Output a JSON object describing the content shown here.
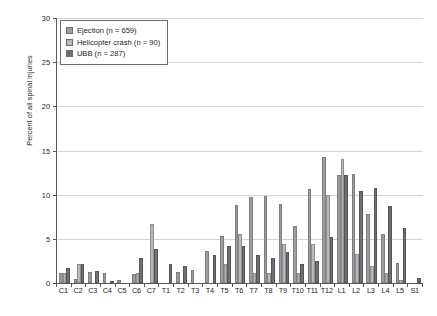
{
  "chart_data": {
    "type": "bar",
    "title": "",
    "subtitle": "",
    "xlabel": "",
    "ylabel": "Percent of all spinal injuries",
    "ylim": [
      0,
      30
    ],
    "yticks": [
      0,
      5,
      10,
      15,
      20,
      25,
      30
    ],
    "grid": "horizontal",
    "legend_position": "top-left",
    "categories": [
      "C1",
      "C2",
      "C3",
      "C4",
      "C5",
      "C6",
      "C7",
      "T1",
      "T2",
      "T3",
      "T4",
      "T5",
      "T6",
      "T7",
      "T8",
      "T9",
      "T10",
      "T11",
      "T12",
      "L1",
      "L2",
      "L3",
      "L4",
      "L5",
      "S1"
    ],
    "series": [
      {
        "name": "Ejection (n = 659)",
        "color": "#9c9d9f",
        "values": [
          1.1,
          0.5,
          1.2,
          1.1,
          0.3,
          1.0,
          0.0,
          0.0,
          1.2,
          1.5,
          3.6,
          5.3,
          8.8,
          9.7,
          9.9,
          8.9,
          6.4,
          10.6,
          14.3,
          12.2,
          12.3,
          7.8,
          5.6,
          2.3,
          0.0
        ]
      },
      {
        "name": "Helicopter crash (n = 90)",
        "color": "#b7b8ba",
        "values": [
          1.1,
          2.2,
          0.0,
          0.0,
          0.0,
          1.1,
          6.7,
          0.0,
          0.0,
          0.0,
          0.0,
          2.2,
          5.6,
          1.1,
          1.1,
          4.4,
          1.1,
          4.4,
          10.0,
          14.0,
          3.3,
          1.9,
          1.1,
          0.3,
          0.0
        ]
      },
      {
        "name": "UBB (n = 287)",
        "color": "#6f7073",
        "values": [
          1.7,
          2.1,
          1.4,
          0.2,
          0.0,
          2.8,
          3.9,
          2.2,
          1.9,
          0.0,
          3.2,
          4.2,
          4.2,
          3.2,
          2.8,
          3.5,
          2.1,
          2.5,
          5.2,
          12.2,
          10.4,
          10.8,
          8.7,
          6.2,
          0.6
        ]
      }
    ],
    "legend": [
      {
        "label": "Ejection (n = 659)",
        "swatch": "#9c9d9f"
      },
      {
        "label": "Helicopter crash (n = 90)",
        "swatch": "#b7b8ba"
      },
      {
        "label": "UBB (n = 287)",
        "swatch": "#6f7073"
      }
    ]
  }
}
